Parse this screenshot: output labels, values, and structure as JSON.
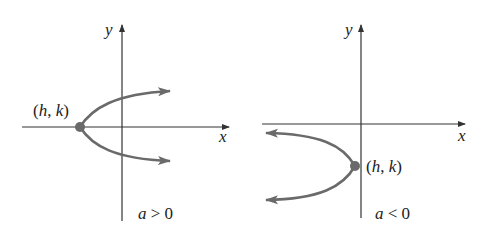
{
  "panels": [
    {
      "id": "left",
      "y_label": "y",
      "x_label": "x",
      "vertex_label": "(h, k)",
      "condition_label": "a > 0",
      "opens": "right"
    },
    {
      "id": "right",
      "y_label": "y",
      "x_label": "x",
      "vertex_label": "(h, k)",
      "condition_label": "a < 0",
      "opens": "left"
    }
  ],
  "colors": {
    "axis": "#333333",
    "curve": "#6a6a6a",
    "vertex": "#6a6a6a"
  }
}
